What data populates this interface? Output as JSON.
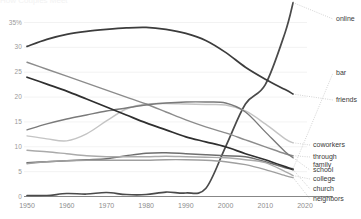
{
  "chart_data": {
    "type": "line",
    "title": "How Couples Meet",
    "subtitle": "",
    "xlabel": "",
    "ylabel": "",
    "xlim": [
      1950,
      2022
    ],
    "ylim": [
      0,
      36
    ],
    "grid": true,
    "grid_axis": "y",
    "legend_position": "right-inline-labels",
    "x_ticks": [
      1950,
      1960,
      1970,
      1980,
      1990,
      2000,
      2010,
      2020
    ],
    "x_tick_labels": [
      "1950",
      "1960",
      "1970",
      "1980",
      "1990",
      "2000",
      "2010",
      "2020"
    ],
    "y_ticks": [
      0,
      5,
      10,
      15,
      20,
      25,
      30,
      35
    ],
    "y_tick_labels": [
      "0",
      "5",
      "10",
      "15",
      "20",
      "25",
      "30",
      "35%"
    ],
    "x": [
      1950,
      1955,
      1960,
      1965,
      1970,
      1975,
      1980,
      1985,
      1990,
      1995,
      2000,
      2005,
      2010,
      2015,
      2017
    ],
    "series": [
      {
        "name": "online",
        "label": "online",
        "color": "#4a4a4a",
        "width": 1.7,
        "label_x": 336,
        "label_y": 16,
        "values": [
          0.2,
          0.2,
          0.6,
          0.5,
          0.8,
          0.4,
          0.4,
          0.9,
          0.7,
          1.6,
          10.0,
          18.6,
          22.5,
          33.0,
          39.0
        ]
      },
      {
        "name": "bar",
        "label": "bar",
        "color": "#6e6e6e",
        "width": 1.5,
        "label_x": 336,
        "label_y": 70,
        "values": [
          6.8,
          7.0,
          7.2,
          7.4,
          7.6,
          8.2,
          8.7,
          8.8,
          8.6,
          8.4,
          8.2,
          8.0,
          7.0,
          5.8,
          5.6
        ]
      },
      {
        "name": "friends",
        "label": "friends",
        "color": "#3c3c3c",
        "width": 1.7,
        "label_x": 336,
        "label_y": 97,
        "values": [
          30.2,
          31.6,
          32.6,
          33.2,
          33.6,
          33.9,
          34.0,
          33.6,
          32.8,
          31.4,
          29.0,
          26.0,
          23.6,
          21.5,
          20.6
        ]
      },
      {
        "name": "coworkers",
        "label": "coworkers",
        "color": "#c4c4c4",
        "width": 1.4,
        "label_x": 313,
        "label_y": 142,
        "values": [
          12.2,
          11.6,
          11.2,
          12.6,
          15.2,
          17.6,
          18.6,
          18.7,
          18.6,
          18.5,
          18.4,
          17.2,
          14.6,
          11.6,
          10.8
        ]
      },
      {
        "name": "through family",
        "label": "through\nfamily",
        "label_line1": "through",
        "label_line2": "family",
        "color": "#8c8c8c",
        "width": 1.4,
        "label_x": 313,
        "label_y": 154,
        "values": [
          27.0,
          25.6,
          24.2,
          22.8,
          21.4,
          20.0,
          18.6,
          17.0,
          15.4,
          14.0,
          12.8,
          11.4,
          10.0,
          8.6,
          8.2
        ]
      },
      {
        "name": "school",
        "label": "school",
        "color": "#7a7a7a",
        "width": 1.4,
        "label_x": 313,
        "label_y": 167,
        "values": [
          13.4,
          14.6,
          15.6,
          16.4,
          17.2,
          17.8,
          18.4,
          18.8,
          19.0,
          19.0,
          18.8,
          17.0,
          13.0,
          9.0,
          7.8
        ]
      },
      {
        "name": "college",
        "label": "college",
        "color": "#aaaaaa",
        "width": 1.4,
        "label_x": 313,
        "label_y": 176,
        "values": [
          9.3,
          9.0,
          8.6,
          8.2,
          8.0,
          8.0,
          8.0,
          8.1,
          8.0,
          7.9,
          7.8,
          7.4,
          6.8,
          5.0,
          4.2
        ]
      },
      {
        "name": "church",
        "label": "church",
        "color": "#2f2f2f",
        "width": 1.7,
        "label_x": 313,
        "label_y": 186,
        "values": [
          24.0,
          22.6,
          21.2,
          19.6,
          18.0,
          16.4,
          14.8,
          13.4,
          12.0,
          11.0,
          10.0,
          8.6,
          7.4,
          6.0,
          5.4
        ]
      },
      {
        "name": "neighbors",
        "label": "neighbors",
        "color": "#9f9f9f",
        "width": 1.4,
        "label_x": 313,
        "label_y": 196,
        "values": [
          6.6,
          7.0,
          7.2,
          7.3,
          7.3,
          7.3,
          7.3,
          7.4,
          7.4,
          7.3,
          7.0,
          6.4,
          5.4,
          4.2,
          3.8
        ]
      }
    ]
  },
  "axes": {
    "y_axis_suffix": "%",
    "grid_color": "#ececec",
    "axis_color": "#555555",
    "tick_text_color": "#949494"
  }
}
